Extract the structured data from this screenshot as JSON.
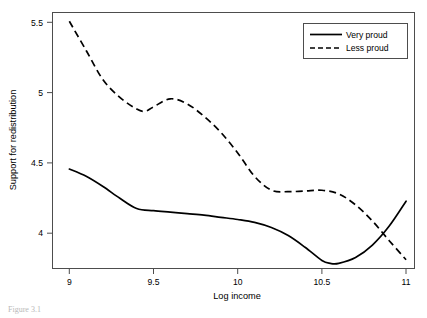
{
  "chart_data": {
    "type": "line",
    "title": "",
    "xlabel": "Log income",
    "ylabel": "Support for redistribution",
    "xlim": [
      9.0,
      11.15
    ],
    "ylim": [
      3.85,
      5.6
    ],
    "xticks": [
      "9",
      "9.5",
      "10",
      "10.5",
      "11"
    ],
    "xtick_values": [
      9,
      9.5,
      10,
      10.5,
      11
    ],
    "yticks": [
      "4",
      "4.5",
      "5",
      "5.5"
    ],
    "ytick_values": [
      4,
      4.5,
      5,
      5.5
    ],
    "grid": false,
    "legend_position": "top-right",
    "series": [
      {
        "name": "Very proud",
        "style": "solid",
        "color": "#000000",
        "x": [
          9.1,
          9.2,
          9.3,
          9.4,
          9.5,
          9.6,
          9.7,
          9.8,
          9.9,
          10.0,
          10.1,
          10.2,
          10.3,
          10.4,
          10.5,
          10.6,
          10.65,
          10.7,
          10.8,
          10.9,
          11.0,
          11.1
        ],
        "y": [
          4.53,
          4.48,
          4.41,
          4.33,
          4.26,
          4.245,
          4.235,
          4.225,
          4.215,
          4.2,
          4.185,
          4.165,
          4.13,
          4.075,
          3.995,
          3.905,
          3.885,
          3.885,
          3.925,
          4.01,
          4.14,
          4.31
        ]
      },
      {
        "name": "Less proud",
        "style": "dashed",
        "color": "#000000",
        "x": [
          9.1,
          9.2,
          9.3,
          9.4,
          9.5,
          9.55,
          9.6,
          9.7,
          9.8,
          9.9,
          10.0,
          10.1,
          10.2,
          10.3,
          10.4,
          10.5,
          10.6,
          10.7,
          10.8,
          10.9,
          11.0,
          11.1
        ],
        "y": [
          5.54,
          5.34,
          5.14,
          5.02,
          4.94,
          4.925,
          4.955,
          5.01,
          4.975,
          4.89,
          4.78,
          4.64,
          4.48,
          4.385,
          4.375,
          4.38,
          4.385,
          4.36,
          4.285,
          4.175,
          4.04,
          3.91
        ]
      }
    ],
    "annotations": {
      "crossing_point_x": 10.9
    }
  },
  "legend": {
    "items": [
      {
        "label": "Very proud",
        "style": "solid"
      },
      {
        "label": "Less proud",
        "style": "dashed"
      }
    ]
  },
  "caption": "Figure 3.1"
}
